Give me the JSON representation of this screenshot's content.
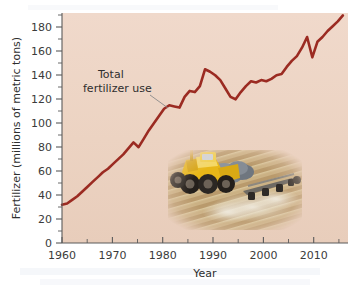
{
  "figure": {
    "background_color": "#ffffff",
    "plot_background_color": "#edd4c4",
    "line_color": "#9b2b22",
    "axis_color": "#5a5a5a",
    "leader_line_color": "#8a8a8a"
  },
  "annotation": {
    "line1": "Total",
    "line2": "fertilizer use"
  },
  "inset_photo": {
    "name": "tractor-applying-fertilizer-photo",
    "description": "Yellow agricultural applicator spreading fertilizer across a plowed field",
    "field_color": "#cbb184",
    "furrow_color": "#a98d61",
    "tractor_body_color": "#e8b718",
    "tractor_cab_color": "#f2d14a",
    "tank_color": "#7c838c",
    "tire_color": "#2b2723",
    "dust_color": "#e4ded2"
  },
  "chart_data": {
    "type": "line",
    "title": "",
    "xlabel": "Year",
    "ylabel": "Fertilizer (millions of metric tons)",
    "xlim": [
      1960,
      2016
    ],
    "ylim": [
      0,
      192
    ],
    "xticks": [
      1960,
      1970,
      1980,
      1990,
      2000,
      2010
    ],
    "xtick_labels": [
      "1960",
      "1970",
      "1980",
      "1990",
      "2000",
      "2010"
    ],
    "x_minor_tick_interval": 5,
    "yticks": [
      0,
      20,
      40,
      60,
      80,
      100,
      120,
      140,
      160,
      180
    ],
    "ytick_labels": [
      "0",
      "20",
      "40",
      "60",
      "80",
      "100",
      "120",
      "140",
      "160",
      "180"
    ],
    "y_minor_tick_interval": 10,
    "grid": false,
    "legend": false,
    "series": [
      {
        "name": "Total fertilizer use",
        "color": "#9b2b22",
        "x": [
          1960,
          1961,
          1962,
          1963,
          1964,
          1965,
          1966,
          1967,
          1968,
          1969,
          1970,
          1971,
          1972,
          1973,
          1974,
          1975,
          1976,
          1977,
          1978,
          1979,
          1980,
          1981,
          1982,
          1983,
          1984,
          1985,
          1986,
          1987,
          1988,
          1989,
          1990,
          1991,
          1992,
          1993,
          1994,
          1995,
          1996,
          1997,
          1998,
          1999,
          2000,
          2001,
          2002,
          2003,
          2004,
          2005,
          2006,
          2007,
          2008,
          2009,
          2010,
          2011,
          2012,
          2013,
          2014,
          2015
        ],
        "values": [
          32,
          33,
          36,
          39,
          43,
          47,
          51,
          55,
          59,
          62,
          66,
          70,
          74,
          79,
          84,
          80,
          87,
          94,
          100,
          106,
          112,
          115,
          114,
          113,
          122,
          127,
          126,
          131,
          145,
          143,
          140,
          136,
          129,
          122,
          120,
          126,
          131,
          135,
          134,
          136,
          135,
          137,
          140,
          141,
          147,
          152,
          156,
          163,
          172,
          155,
          168,
          172,
          177,
          181,
          185,
          190
        ]
      }
    ]
  }
}
